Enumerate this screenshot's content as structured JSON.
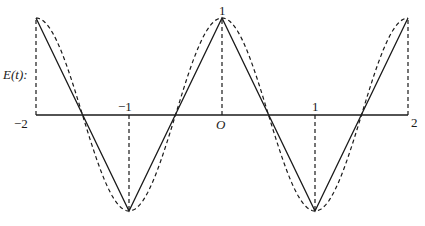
{
  "chart_data": {
    "type": "line",
    "title": "",
    "xlabel": "",
    "ylabel": "E(t):",
    "xlim": [
      -2,
      2
    ],
    "ylim": [
      -1,
      1
    ],
    "x_ticks": [
      "-2",
      "-1",
      "O",
      "1",
      "2"
    ],
    "y_ticks": [
      "1"
    ],
    "grid": false,
    "legend": null,
    "series": [
      {
        "name": "triangle wave (solid)",
        "style": "solid",
        "x": [
          -2,
          -1,
          0,
          1,
          2
        ],
        "y": [
          1,
          -1,
          1,
          -1,
          1
        ]
      },
      {
        "name": "cos(pi t) approximation (dashed)",
        "style": "dashed",
        "x": [
          -2,
          -1.5,
          -1,
          -0.5,
          0,
          0.5,
          1,
          1.5,
          2
        ],
        "y": [
          1,
          0,
          -1,
          0,
          1,
          0,
          -1,
          0,
          1
        ]
      }
    ],
    "annotations": [
      {
        "type": "dashed-vertical",
        "x": -2,
        "from": 0,
        "to": 1
      },
      {
        "type": "dashed-vertical",
        "x": -1,
        "from": 0,
        "to": -1
      },
      {
        "type": "dashed-vertical",
        "x": 0,
        "from": 0,
        "to": 1
      },
      {
        "type": "dashed-vertical",
        "x": 1,
        "from": 0,
        "to": -1
      },
      {
        "type": "dashed-vertical",
        "x": 2,
        "from": 0,
        "to": 1
      }
    ]
  },
  "labels": {
    "ylabel": "E(t):",
    "x_neg2": "−2",
    "x_neg1": "−1",
    "x_zero": "O",
    "x_pos1": "1",
    "x_pos2": "2",
    "y_top": "1"
  },
  "colors": {
    "ink": "#1a1a1a",
    "background": "#ffffff"
  }
}
